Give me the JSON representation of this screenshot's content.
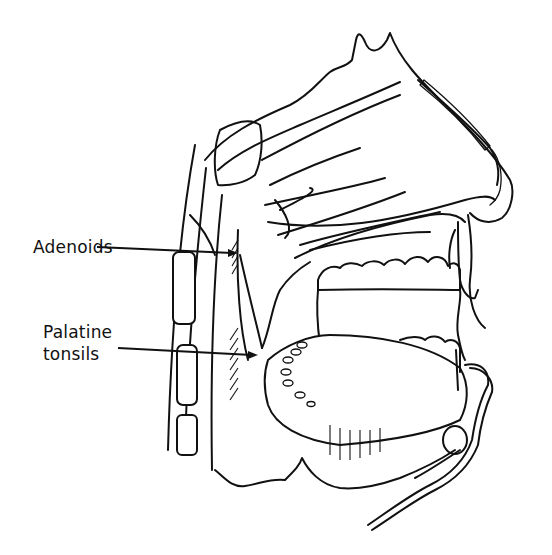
{
  "figure": {
    "labels": [
      {
        "id": "adenoids",
        "text": "Adenoids"
      },
      {
        "id": "palatine-tonsils",
        "lines": [
          "Palatine",
          "tonsils"
        ]
      }
    ],
    "colors": {
      "ink": "#111111",
      "background": "#ffffff"
    }
  }
}
